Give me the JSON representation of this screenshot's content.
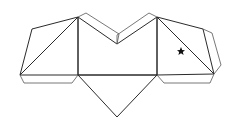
{
  "diagram": {
    "type": "polyhedron-net",
    "stroke_color": "#2a2a2a",
    "tab_stroke_color": "#555555",
    "marker": {
      "symbol": "★",
      "x": 181,
      "y": 51
    }
  }
}
